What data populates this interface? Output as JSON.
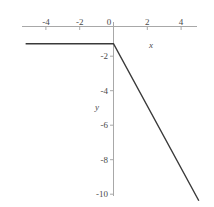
{
  "chart_data": {
    "type": "line",
    "title": "",
    "subtitle": "",
    "xlabel": "x",
    "ylabel": "y",
    "xlim": [
      -5.2,
      5.2
    ],
    "ylim": [
      -10.6,
      0.6
    ],
    "grid": false,
    "legend": null,
    "xticks": [
      -4,
      -2,
      0,
      2,
      4
    ],
    "xtick_labels": [
      "-4",
      "-2",
      "0",
      "2",
      "4"
    ],
    "yticks": [
      -2,
      -4,
      -6,
      -8,
      -10
    ],
    "ytick_labels": [
      "-2",
      "-4",
      "-6",
      "-8",
      "-10"
    ],
    "series": [
      {
        "name": "piecewise-linear",
        "x": [
          -5.2,
          0,
          5.05
        ],
        "y": [
          -1,
          -1,
          -10.1
        ],
        "color": "#3a3a3a",
        "linewidth": 1.4
      }
    ],
    "annotations": [],
    "axis_color": "#a8a8a8",
    "text_color": "#4a4a4a"
  },
  "axes": {
    "x_axis_name": "x",
    "y_axis_name": "y"
  },
  "ticks": {
    "x": [
      {
        "label": "-4",
        "value": -4
      },
      {
        "label": "-2",
        "value": -2
      },
      {
        "label": "0",
        "value": 0
      },
      {
        "label": "2",
        "value": 2
      },
      {
        "label": "4",
        "value": 4
      }
    ],
    "y": [
      {
        "label": "-2",
        "value": -2
      },
      {
        "label": "-4",
        "value": -4
      },
      {
        "label": "-6",
        "value": -6
      },
      {
        "label": "-8",
        "value": -8
      },
      {
        "label": "-10",
        "value": -10
      }
    ]
  }
}
